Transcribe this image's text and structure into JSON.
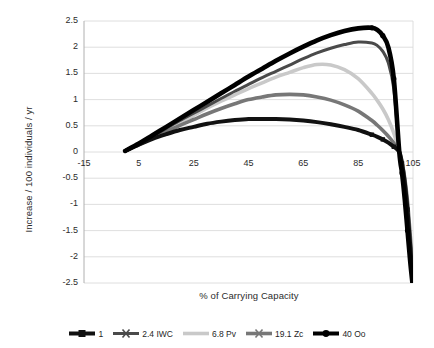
{
  "chart_data": {
    "type": "line",
    "title": "",
    "xlabel": "% of Carrying Capacity",
    "ylabel": "Increase / 100 individuals / yr",
    "xlim": [
      -15,
      105
    ],
    "ylim": [
      -2.5,
      2.5
    ],
    "xticks": [
      "-15",
      "5",
      "25",
      "45",
      "65",
      "85",
      "105"
    ],
    "xtick_values": [
      -15,
      5,
      25,
      45,
      65,
      85,
      105
    ],
    "yticks": [
      "2.5",
      "2",
      "1.5",
      "1",
      "0.5",
      "0",
      "-0.5",
      "-1",
      "-1.5",
      "-2",
      "-2.5"
    ],
    "ytick_values": [
      2.5,
      2,
      1.5,
      1,
      0.5,
      0,
      -0.5,
      -1,
      -1.5,
      -2,
      -2.5
    ],
    "grid": true,
    "grid_axis": "y",
    "legend_position": "bottom",
    "x": [
      0,
      5,
      10,
      15,
      20,
      25,
      30,
      35,
      40,
      45,
      50,
      55,
      60,
      65,
      70,
      75,
      80,
      85,
      90,
      92,
      94,
      96,
      98,
      100,
      101,
      102,
      103,
      104,
      105
    ],
    "series": [
      {
        "name": "1",
        "color": "#111111",
        "marker": "square",
        "linewidth": 4.0,
        "values": [
          0.02,
          0.14,
          0.25,
          0.34,
          0.42,
          0.48,
          0.54,
          0.58,
          0.61,
          0.63,
          0.63,
          0.63,
          0.62,
          0.6,
          0.57,
          0.53,
          0.48,
          0.42,
          0.33,
          0.29,
          0.24,
          0.18,
          0.1,
          0.0,
          -0.22,
          -0.58,
          -1.1,
          -1.8,
          -2.5
        ]
      },
      {
        "name": "2.4 IWC",
        "color": "#4a4a4a",
        "marker": "cross",
        "linewidth": 3.0,
        "values": [
          0.02,
          0.15,
          0.3,
          0.45,
          0.6,
          0.74,
          0.88,
          1.02,
          1.16,
          1.29,
          1.42,
          1.54,
          1.66,
          1.78,
          1.89,
          1.98,
          2.05,
          2.1,
          2.08,
          2.03,
          1.92,
          1.7,
          1.2,
          0.0,
          -0.35,
          -0.8,
          -1.4,
          -2.0,
          -2.5
        ]
      },
      {
        "name": "6.8 Pv",
        "color": "#c9c9c9",
        "marker": "none",
        "linewidth": 3.6,
        "values": [
          0.02,
          0.15,
          0.29,
          0.43,
          0.57,
          0.7,
          0.84,
          0.97,
          1.09,
          1.21,
          1.32,
          1.43,
          1.52,
          1.61,
          1.67,
          1.66,
          1.57,
          1.4,
          1.12,
          0.98,
          0.82,
          0.62,
          0.36,
          0.0,
          -0.3,
          -0.7,
          -1.25,
          -1.9,
          -2.5
        ]
      },
      {
        "name": "19.1 Zc",
        "color": "#777777",
        "marker": "cross",
        "linewidth": 3.6,
        "values": [
          0.02,
          0.14,
          0.27,
          0.39,
          0.51,
          0.62,
          0.73,
          0.83,
          0.92,
          1.0,
          1.05,
          1.09,
          1.1,
          1.09,
          1.05,
          0.99,
          0.9,
          0.78,
          0.6,
          0.51,
          0.41,
          0.3,
          0.17,
          0.0,
          -0.2,
          -0.5,
          -0.95,
          -1.6,
          -2.3
        ]
      },
      {
        "name": "40 Oo",
        "color": "#000000",
        "marker": "circle",
        "linewidth": 4.6,
        "values": [
          0.02,
          0.16,
          0.32,
          0.48,
          0.64,
          0.8,
          0.96,
          1.12,
          1.28,
          1.44,
          1.59,
          1.74,
          1.88,
          2.01,
          2.13,
          2.23,
          2.31,
          2.36,
          2.37,
          2.33,
          2.22,
          2.0,
          1.4,
          0.0,
          -0.4,
          -0.9,
          -1.5,
          -2.1,
          -2.6
        ]
      }
    ]
  }
}
